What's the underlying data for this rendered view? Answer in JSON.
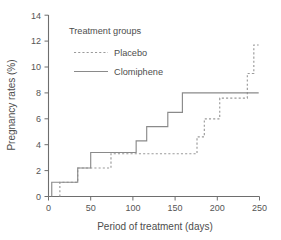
{
  "chart_data": {
    "type": "line",
    "title": "",
    "subtitle": "",
    "xlabel": "Period of treatment (days)",
    "ylabel": "Pregnancy rates (%)",
    "xlim": [
      0,
      260
    ],
    "ylim": [
      0,
      14
    ],
    "xticks": [
      0,
      50,
      100,
      150,
      200,
      250
    ],
    "xtick_labels": [
      "0",
      "50",
      "100",
      "150",
      "200",
      "250"
    ],
    "yticks": [
      0,
      2,
      4,
      6,
      8,
      10,
      12,
      14
    ],
    "ytick_labels": [
      "0",
      "2",
      "4",
      "6",
      "8",
      "10",
      "12",
      "14"
    ],
    "grid": false,
    "legend_title": "Treatment groups",
    "legend_position": "upper-left-inside",
    "style": "step-post",
    "series": [
      {
        "name": "Placebo",
        "line_style": "dashed",
        "color": "#9a9a9a",
        "x": [
          14,
          14,
          36,
          36,
          56,
          56,
          77,
          77,
          183,
          183,
          192,
          192,
          211,
          211,
          245,
          245,
          253,
          253,
          259
        ],
        "y": [
          0,
          1.1,
          1.1,
          2.2,
          2.2,
          2.2,
          2.2,
          3.3,
          3.3,
          4.6,
          4.6,
          6.0,
          6.0,
          7.6,
          7.6,
          9.5,
          9.5,
          11.7,
          11.7
        ],
        "step_points": [
          {
            "x": 14,
            "y": 1.1
          },
          {
            "x": 36,
            "y": 2.2
          },
          {
            "x": 77,
            "y": 3.3
          },
          {
            "x": 183,
            "y": 4.6
          },
          {
            "x": 192,
            "y": 6.0
          },
          {
            "x": 211,
            "y": 7.6
          },
          {
            "x": 245,
            "y": 9.5
          },
          {
            "x": 253,
            "y": 11.7
          }
        ]
      },
      {
        "name": "Clomiphene",
        "line_style": "solid",
        "color": "#8a8a8a",
        "x": [
          4,
          4,
          36,
          36,
          52,
          52,
          108,
          108,
          121,
          121,
          147,
          147,
          165,
          165,
          259
        ],
        "y": [
          0,
          1.1,
          1.1,
          2.2,
          2.2,
          3.4,
          3.4,
          4.3,
          4.3,
          5.4,
          5.4,
          6.5,
          6.5,
          8.0,
          8.0
        ],
        "step_points": [
          {
            "x": 4,
            "y": 1.1
          },
          {
            "x": 36,
            "y": 2.2
          },
          {
            "x": 52,
            "y": 3.4
          },
          {
            "x": 108,
            "y": 4.3
          },
          {
            "x": 121,
            "y": 5.4
          },
          {
            "x": 147,
            "y": 6.5
          },
          {
            "x": 165,
            "y": 8.0
          }
        ]
      }
    ]
  },
  "legend": {
    "title": "Treatment groups",
    "entries": [
      {
        "label": "Placebo",
        "style": "dashed"
      },
      {
        "label": "Clomiphene",
        "style": "solid"
      }
    ]
  },
  "axes": {
    "x_title": "Period of treatment (days)",
    "y_title": "Pregnancy rates (%)"
  }
}
